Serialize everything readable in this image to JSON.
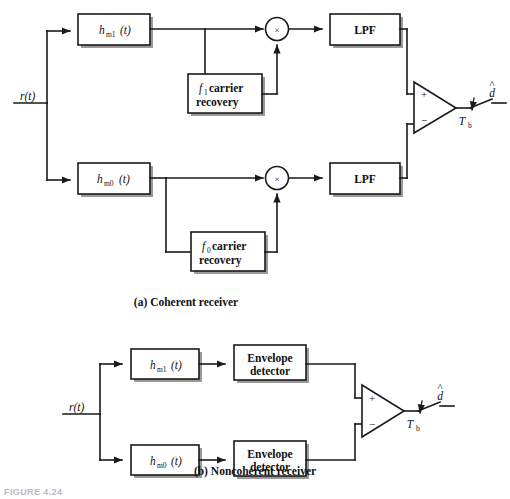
{
  "figure": {
    "label": "FIGURE 4.24",
    "captions": {
      "a": "(a) Coherent receiver",
      "b": "(b) Noncoherent receiver"
    }
  },
  "symbols": {
    "input_signal": "r(t)",
    "output_decision": "d",
    "output_hat": "^",
    "sample_period": "T",
    "sample_period_sub": "b",
    "multiply": "×",
    "plus": "+",
    "minus": "−"
  },
  "coherent": {
    "blocks": {
      "filter1": {
        "base": "h",
        "sub": "m1",
        "arg": "(t)"
      },
      "filter0": {
        "base": "h",
        "sub": "m0",
        "arg": "(t)"
      },
      "carrier1": {
        "freq": "f",
        "freq_sub": "1",
        "line1_rest": " carrier",
        "line2": "recovery"
      },
      "carrier0": {
        "freq": "f",
        "freq_sub": "0",
        "line1_rest": " carrier",
        "line2": "recovery"
      },
      "lpf_top": "LPF",
      "lpf_bottom": "LPF"
    }
  },
  "noncoherent": {
    "blocks": {
      "filter1": {
        "base": "h",
        "sub": "m1",
        "arg": "(t)"
      },
      "filter0": {
        "base": "h",
        "sub": "m0",
        "arg": "(t)"
      },
      "envelope_top": {
        "line1": "Envelope",
        "line2": "detector"
      },
      "envelope_bottom": {
        "line1": "Envelope",
        "line2": "detector"
      }
    }
  },
  "colors": {
    "line": "#1a1a1a",
    "box_fill": "#ffffff",
    "shadow": "#9a9a9a",
    "text": "#111111"
  }
}
